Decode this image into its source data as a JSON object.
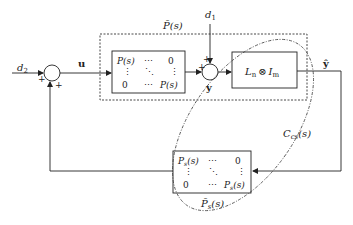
{
  "diagram": {
    "type": "block-diagram",
    "signals": {
      "d2": "d",
      "d2_sub": "2",
      "d1": "d",
      "d1_sub": "1",
      "u": "u",
      "y": "y",
      "y_hat": "ŷ"
    },
    "blocks": {
      "plant_group_label": "P̄(s)",
      "plant_matrix": {
        "r1c1": "P(s)",
        "r1c2": "⋯",
        "r1c3": "0",
        "r2c1": "⋮",
        "r2c2": "⋱",
        "r2c3": "⋮",
        "r3c1": "0",
        "r3c2": "⋯",
        "r3c3": "P(s)"
      },
      "laplacian_block": {
        "L": "L",
        "L_sub": "n",
        "op": "⊗",
        "I": "I",
        "I_sub": "m"
      },
      "sensor_group_label": "P̄",
      "sensor_group_sub": "s",
      "sensor_group_arg": "(s)",
      "sensor_matrix": {
        "r1c1": "P",
        "r1c1_sub": "s",
        "r1c1_arg": "(s)",
        "r1c2": "⋯",
        "r1c3": "0",
        "r2c1": "⋮",
        "r2c2": "⋱",
        "r2c3": "⋮",
        "r3c1": "0",
        "r3c2": "⋯",
        "r3c3": "P",
        "r3c3_sub": "s",
        "r3c3_arg": "(s)"
      },
      "closed_loop_label": "C",
      "closed_loop_sub": "cs",
      "closed_loop_arg": "(s)"
    },
    "summing_junctions": [
      {
        "id": "input-sum",
        "signs": [
          "+",
          "+"
        ]
      },
      {
        "id": "output-sum",
        "signs": [
          "+",
          "+"
        ]
      }
    ]
  }
}
